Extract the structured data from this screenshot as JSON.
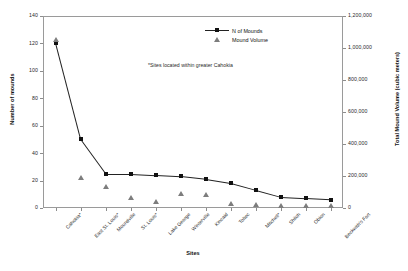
{
  "chart_data": {
    "type": "line",
    "title": "",
    "categories": [
      "Cahokia*",
      "East St. Louis*",
      "Moundville",
      "St. Louis*",
      "Lake George",
      "Winterville",
      "Kincaid",
      "Toltec",
      "Mitchell*",
      "Shiloh",
      "Obion",
      "Beckwith's Fort"
    ],
    "series": [
      {
        "name": "N of Mounds",
        "axis": "left",
        "marker": "square",
        "values": [
          120,
          50,
          25,
          25,
          24,
          23,
          21,
          18,
          13,
          8,
          7,
          6
        ]
      },
      {
        "name": "Mound Volume",
        "axis": "right",
        "marker": "triangle",
        "values": [
          1050000,
          190000,
          130000,
          60000,
          40000,
          90000,
          80000,
          25000,
          20000,
          15000,
          12000,
          10000
        ]
      }
    ],
    "xlabel": "Sites",
    "ylabel": "Number of mounds",
    "y2label": "Total Mound Volume (cubic meters)",
    "ylim": [
      0,
      140
    ],
    "y2lim": [
      0,
      1200000
    ],
    "yticks": [
      "0",
      "20",
      "40",
      "60",
      "80",
      "100",
      "120",
      "140"
    ],
    "y2ticks": [
      "0",
      "200,000",
      "400,000",
      "600,000",
      "800,000",
      "1,000,000",
      "1,200,000"
    ],
    "grid": false,
    "legend_position": "top-right",
    "annotation": "*Sites located within greater Cahokia"
  },
  "legend": {
    "items": [
      {
        "label": "N of Mounds",
        "marker": "square-line"
      },
      {
        "label": "Mound Volume",
        "marker": "triangle"
      }
    ]
  }
}
